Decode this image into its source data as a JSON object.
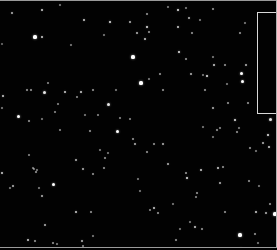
{
  "image": {
    "width": 277,
    "height": 250,
    "background": "#020202",
    "description": "star field",
    "roi_box": {
      "x": 257,
      "y": 12,
      "width": 20,
      "height": 102,
      "color": "#d8d8d8"
    },
    "stars": [
      [
        12,
        13,
        1.2,
        0.7
      ],
      [
        42,
        10,
        1.2,
        0.8
      ],
      [
        35,
        37,
        1.6,
        1.0
      ],
      [
        42,
        37,
        1.3,
        0.8
      ],
      [
        60,
        5,
        0.9,
        0.5
      ],
      [
        84,
        20,
        1.3,
        0.8
      ],
      [
        110,
        22,
        1.4,
        0.9
      ],
      [
        130,
        22,
        1.1,
        0.7
      ],
      [
        104,
        35,
        0.9,
        0.5
      ],
      [
        71,
        45,
        0.9,
        0.5
      ],
      [
        2,
        44,
        0.8,
        0.4
      ],
      [
        133,
        57,
        1.6,
        1.0
      ],
      [
        116,
        90,
        0.9,
        0.5
      ],
      [
        81,
        92,
        1.3,
        0.8
      ],
      [
        93,
        90,
        1.0,
        0.6
      ],
      [
        44,
        92,
        1.5,
        0.9
      ],
      [
        31,
        90,
        1.0,
        0.6
      ],
      [
        27,
        90,
        1.0,
        0.6
      ],
      [
        65,
        92,
        1.3,
        0.8
      ],
      [
        3,
        96,
        1.3,
        0.8
      ],
      [
        2,
        108,
        0.9,
        0.5
      ],
      [
        18,
        116,
        1.5,
        1.0
      ],
      [
        29,
        121,
        1.0,
        0.6
      ],
      [
        42,
        119,
        0.9,
        0.5
      ],
      [
        108,
        104,
        1.5,
        0.9
      ],
      [
        85,
        115,
        0.9,
        0.5
      ],
      [
        178,
        10,
        1.4,
        0.9
      ],
      [
        186,
        8,
        0.9,
        0.5
      ],
      [
        213,
        9,
        1.0,
        0.6
      ],
      [
        168,
        7,
        0.9,
        0.5
      ],
      [
        147,
        14,
        1.0,
        0.6
      ],
      [
        189,
        18,
        1.2,
        0.7
      ],
      [
        245,
        23,
        0.9,
        0.5
      ],
      [
        178,
        27,
        1.3,
        0.8
      ],
      [
        149,
        32,
        1.0,
        0.6
      ],
      [
        147,
        27,
        1.4,
        0.9
      ],
      [
        192,
        33,
        1.0,
        0.6
      ],
      [
        137,
        33,
        1.1,
        0.7
      ],
      [
        145,
        39,
        1.3,
        0.8
      ],
      [
        240,
        33,
        1.0,
        0.6
      ],
      [
        200,
        20,
        0.9,
        0.5
      ],
      [
        179,
        52,
        1.4,
        0.9
      ],
      [
        186,
        59,
        1.0,
        0.6
      ],
      [
        213,
        57,
        0.9,
        0.5
      ],
      [
        214,
        65,
        1.3,
        0.8
      ],
      [
        225,
        65,
        1.0,
        0.6
      ],
      [
        246,
        65,
        1.2,
        0.7
      ],
      [
        191,
        74,
        1.2,
        0.7
      ],
      [
        160,
        74,
        1.0,
        0.6
      ],
      [
        207,
        76,
        1.4,
        0.9
      ],
      [
        203,
        75,
        0.9,
        0.5
      ],
      [
        241,
        73,
        1.5,
        1.0
      ],
      [
        242,
        81,
        1.5,
        1.0
      ],
      [
        227,
        84,
        0.9,
        0.5
      ],
      [
        141,
        83,
        1.6,
        1.0
      ],
      [
        149,
        79,
        0.9,
        0.5
      ],
      [
        163,
        90,
        1.0,
        0.6
      ],
      [
        205,
        90,
        1.0,
        0.6
      ],
      [
        213,
        108,
        1.2,
        0.7
      ],
      [
        228,
        103,
        1.0,
        0.6
      ],
      [
        248,
        103,
        1.0,
        0.6
      ],
      [
        270,
        119,
        1.5,
        0.9
      ],
      [
        213,
        137,
        0.9,
        0.5
      ],
      [
        235,
        120,
        1.4,
        0.9
      ],
      [
        268,
        135,
        1.4,
        0.9
      ],
      [
        263,
        143,
        1.2,
        0.7
      ],
      [
        269,
        147,
        1.3,
        0.8
      ],
      [
        256,
        151,
        0.9,
        0.5
      ],
      [
        237,
        132,
        1.0,
        0.6
      ],
      [
        239,
        128,
        0.9,
        0.5
      ],
      [
        217,
        130,
        1.0,
        0.6
      ],
      [
        220,
        128,
        0.8,
        0.5
      ],
      [
        203,
        127,
        0.9,
        0.5
      ],
      [
        218,
        168,
        1.3,
        0.8
      ],
      [
        223,
        167,
        1.0,
        0.6
      ],
      [
        250,
        148,
        1.0,
        0.6
      ],
      [
        201,
        170,
        1.3,
        0.8
      ],
      [
        220,
        183,
        1.2,
        0.7
      ],
      [
        249,
        181,
        1.0,
        0.6
      ],
      [
        259,
        186,
        0.9,
        0.5
      ],
      [
        202,
        229,
        1.0,
        0.6
      ],
      [
        225,
        212,
        1.0,
        0.6
      ],
      [
        256,
        212,
        1.3,
        0.8
      ],
      [
        270,
        204,
        1.0,
        0.6
      ],
      [
        266,
        213,
        1.2,
        0.7
      ],
      [
        275,
        214,
        1.6,
        1.0
      ],
      [
        240,
        235,
        1.6,
        1.0
      ],
      [
        255,
        234,
        1.0,
        0.6
      ],
      [
        258,
        243,
        0.9,
        0.5
      ],
      [
        241,
        248,
        1.0,
        0.6
      ],
      [
        163,
        144,
        1.2,
        0.7
      ],
      [
        187,
        178,
        1.4,
        0.9
      ],
      [
        186,
        173,
        1.0,
        0.6
      ],
      [
        197,
        193,
        1.0,
        0.6
      ],
      [
        196,
        197,
        0.8,
        0.5
      ],
      [
        154,
        144,
        1.0,
        0.6
      ],
      [
        168,
        164,
        1.2,
        0.7
      ],
      [
        154,
        208,
        1.3,
        0.8
      ],
      [
        158,
        213,
        1.0,
        0.6
      ],
      [
        176,
        240,
        1.0,
        0.6
      ],
      [
        147,
        152,
        1.0,
        0.6
      ],
      [
        135,
        144,
        1.2,
        0.7
      ],
      [
        140,
        191,
        0.9,
        0.5
      ],
      [
        173,
        204,
        0.9,
        0.5
      ],
      [
        180,
        229,
        0.9,
        0.5
      ],
      [
        117,
        131,
        1.5,
        1.0
      ],
      [
        90,
        131,
        1.0,
        0.6
      ],
      [
        105,
        158,
        1.0,
        0.6
      ],
      [
        104,
        168,
        1.0,
        0.6
      ],
      [
        76,
        160,
        1.2,
        0.7
      ],
      [
        83,
        169,
        1.2,
        0.7
      ],
      [
        93,
        174,
        1.0,
        0.6
      ],
      [
        100,
        150,
        0.9,
        0.5
      ],
      [
        53,
        184,
        1.5,
        1.0
      ],
      [
        39,
        188,
        0.9,
        0.5
      ],
      [
        42,
        196,
        1.2,
        0.7
      ],
      [
        13,
        186,
        1.2,
        0.7
      ],
      [
        10,
        188,
        0.9,
        0.5
      ],
      [
        2,
        173,
        1.3,
        0.8
      ],
      [
        33,
        168,
        0.9,
        0.5
      ],
      [
        37,
        170,
        0.9,
        0.5
      ],
      [
        36,
        172,
        1.0,
        0.6
      ],
      [
        34,
        169,
        0.9,
        0.5
      ],
      [
        29,
        155,
        0.8,
        0.5
      ],
      [
        91,
        212,
        1.0,
        0.6
      ],
      [
        76,
        212,
        1.3,
        0.8
      ],
      [
        45,
        225,
        1.2,
        0.7
      ],
      [
        28,
        240,
        1.3,
        0.8
      ],
      [
        35,
        241,
        1.0,
        0.6
      ],
      [
        53,
        243,
        1.0,
        0.6
      ],
      [
        57,
        244,
        0.9,
        0.5
      ],
      [
        82,
        241,
        1.2,
        0.7
      ],
      [
        83,
        246,
        0.8,
        0.5
      ],
      [
        93,
        236,
        0.9,
        0.5
      ],
      [
        138,
        179,
        0.9,
        0.5
      ],
      [
        108,
        153,
        0.9,
        0.5
      ],
      [
        150,
        210,
        0.8,
        0.5
      ],
      [
        195,
        227,
        1.3,
        0.8
      ],
      [
        190,
        222,
        0.9,
        0.5
      ],
      [
        133,
        139,
        1.0,
        0.6
      ],
      [
        120,
        118,
        0.8,
        0.5
      ],
      [
        98,
        115,
        0.8,
        0.5
      ],
      [
        130,
        119,
        0.8,
        0.5
      ],
      [
        60,
        130,
        0.8,
        0.5
      ],
      [
        77,
        97,
        0.8,
        0.5
      ],
      [
        58,
        104,
        0.8,
        0.5
      ],
      [
        48,
        83,
        0.8,
        0.5
      ],
      [
        55,
        112,
        0.8,
        0.5
      ]
    ]
  }
}
